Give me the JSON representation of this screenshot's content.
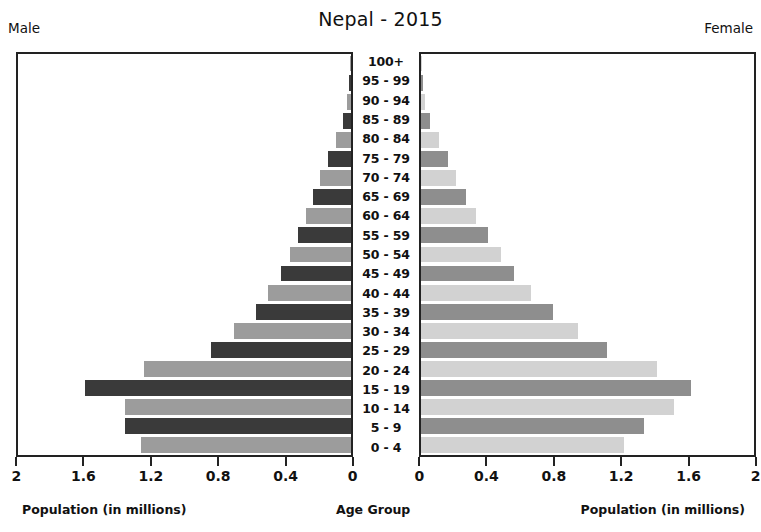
{
  "chart": {
    "title": "Nepal - 2015",
    "left_caption": "Male",
    "right_caption": "Female",
    "xlabel_left": "Population (in millions)",
    "xlabel_center": "Age Group",
    "xlabel_right": "Population (in millions)",
    "left_ticks": [
      "2",
      "1.6",
      "1.2",
      "0.8",
      "0.4",
      "0"
    ],
    "right_ticks": [
      "0",
      "0.4",
      "0.8",
      "1.2",
      "1.6",
      "2"
    ]
  },
  "colors": {
    "male_dark": "#3a3a3a",
    "male_light": "#9c9c9c",
    "female_dark": "#8e8e8e",
    "female_light": "#d2d2d2",
    "axis": "#222222",
    "text": "#111111",
    "background": "#ffffff"
  },
  "chart_data": {
    "type": "bar",
    "title": "Nepal - 2015",
    "xlabel": "Population (in millions)",
    "ylabel": "Age Group",
    "orientation": "horizontal",
    "layout": "population-pyramid",
    "xlim_left": [
      2,
      0
    ],
    "xlim_right": [
      0,
      2
    ],
    "grid": false,
    "legend": "none",
    "categories": [
      "100+",
      "95 - 99",
      "90 - 94",
      "85 - 89",
      "80 - 84",
      "75 - 79",
      "70 - 74",
      "65 - 69",
      "60 - 64",
      "55 - 59",
      "50 - 54",
      "45 - 49",
      "40 - 44",
      "35 - 39",
      "30 - 34",
      "25 - 29",
      "20 - 24",
      "15 - 19",
      "10 - 14",
      "5 - 9",
      "0 - 4"
    ],
    "series": [
      {
        "name": "Male",
        "units": "millions",
        "values": [
          0.004,
          0.01,
          0.022,
          0.046,
          0.093,
          0.136,
          0.184,
          0.23,
          0.272,
          0.318,
          0.366,
          0.42,
          0.5,
          0.572,
          0.7,
          0.84,
          1.245,
          1.6,
          1.36,
          1.36,
          1.26
        ]
      },
      {
        "name": "Female",
        "units": "millions",
        "values": [
          0.004,
          0.012,
          0.026,
          0.054,
          0.107,
          0.16,
          0.21,
          0.268,
          0.33,
          0.4,
          0.48,
          0.56,
          0.66,
          0.79,
          0.94,
          1.12,
          1.42,
          1.62,
          1.52,
          1.34,
          1.22
        ]
      }
    ]
  }
}
